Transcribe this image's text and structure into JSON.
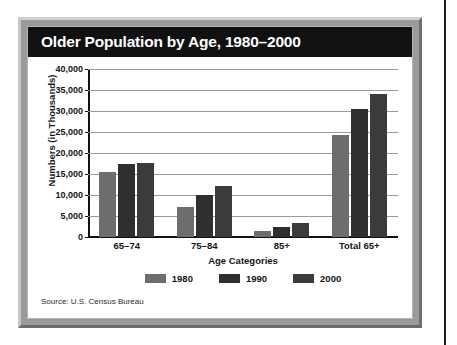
{
  "figure": {
    "title": "Older Population by Age, 1980–2000",
    "source_note": "Source: U.S. Census Bureau"
  },
  "chart_data": {
    "type": "bar",
    "title": "Older Population by Age, 1980–2000",
    "xlabel": "Age Categories",
    "ylabel": "Numbers (in Thousands)",
    "categories": [
      "65–74",
      "75–84",
      "85+",
      "Total 65+"
    ],
    "series": [
      {
        "name": "1980",
        "color": "#6d6d6d",
        "values": [
          15580,
          7230,
          1410,
          24240
        ]
      },
      {
        "name": "1990",
        "color": "#2f2f2f",
        "values": [
          17330,
          9990,
          2280,
          30590
        ]
      },
      {
        "name": "2000",
        "color": "#3b3b3b",
        "values": [
          17700,
          12030,
          3410,
          34120
        ]
      }
    ],
    "ylim": [
      0,
      40000
    ],
    "ytick_values": [
      0,
      5000,
      10000,
      15000,
      20000,
      25000,
      30000,
      35000,
      40000
    ],
    "ytick_labels": [
      "0",
      "5,000",
      "10,000",
      "15,000",
      "20,000",
      "25,000",
      "30,000",
      "35,000",
      "40,000"
    ],
    "grid": true,
    "legend_position": "bottom",
    "legend_entries": [
      "1980",
      "1990",
      "2000"
    ]
  }
}
